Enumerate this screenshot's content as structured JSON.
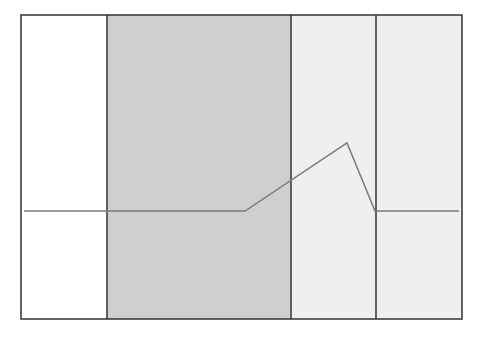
{
  "chart_data": {
    "type": "line",
    "title": "",
    "xlabel": "",
    "ylabel": "",
    "grid": false,
    "legend": null,
    "frame": {
      "x0": 21,
      "y0": 15,
      "x1": 462,
      "y1": 319
    },
    "bands": [
      {
        "name": "region-1",
        "x_start": 21,
        "x_end": 107,
        "color": "#ffffff"
      },
      {
        "name": "region-2",
        "x_start": 107,
        "x_end": 291,
        "color": "#cfcfcf"
      },
      {
        "name": "region-3",
        "x_start": 291,
        "x_end": 376,
        "color": "#efefef"
      },
      {
        "name": "region-4",
        "x_start": 376,
        "x_end": 462,
        "color": "#efefef"
      }
    ],
    "series": [
      {
        "name": "signal",
        "color": "#7a7a7a",
        "points": [
          [
            24,
            211
          ],
          [
            245,
            211
          ],
          [
            347,
            143
          ],
          [
            375,
            211
          ],
          [
            459,
            211
          ]
        ]
      }
    ],
    "border_color": "#333333"
  }
}
